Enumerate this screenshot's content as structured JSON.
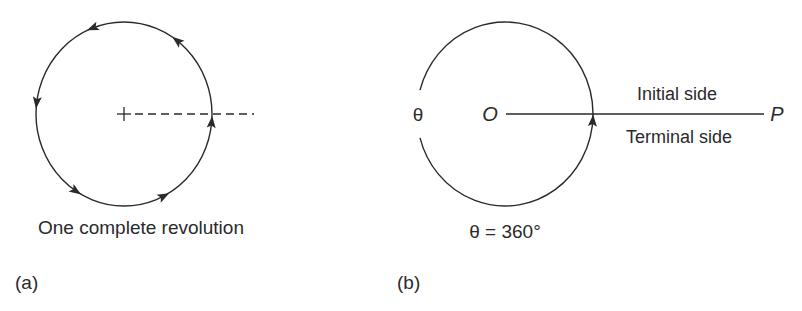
{
  "figure": {
    "panels": [
      {
        "id": "a",
        "panel_label": "(a)",
        "caption": "One complete revolution",
        "center": [
          124,
          114
        ],
        "radius": 90,
        "arrow_angles_deg": [
          -5,
          53,
          111,
          173,
          237,
          297
        ],
        "direction": "counterclockwise",
        "reference_line": "dashed",
        "center_marker": "+"
      },
      {
        "id": "b",
        "panel_label": "(b)",
        "caption": "θ = 360°",
        "center": [
          505,
          114
        ],
        "radius": 89,
        "angle_label": "θ",
        "origin_label": "O",
        "endpoint_label": "P",
        "initial_side_label": "Initial side",
        "terminal_side_label": "Terminal side",
        "arrow_angle_deg": -4
      }
    ],
    "stroke_color": "#2a2a2a",
    "background": "#ffffff"
  }
}
